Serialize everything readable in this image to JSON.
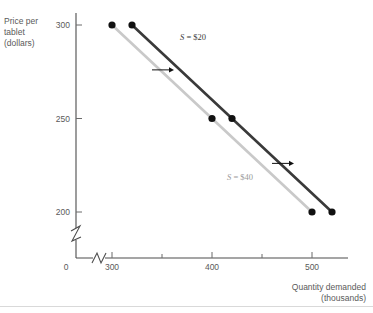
{
  "chart_data": {
    "type": "line",
    "title": "",
    "xlabel": "Quantity demanded",
    "xlabel_sub": "(thousands)",
    "ylabel": "Price per",
    "ylabel_line2": "tablet",
    "ylabel_sub": "(dollars)",
    "origin_label": "0",
    "xlim": [
      280,
      560
    ],
    "ylim": [
      190,
      310
    ],
    "x_ticks_major": [
      300,
      400,
      500
    ],
    "x_ticks_minor": [
      350,
      450,
      550
    ],
    "x_tick_labels": [
      "300",
      "400",
      "500"
    ],
    "y_ticks": [
      200,
      250,
      300
    ],
    "y_tick_labels": [
      "200",
      "250",
      "300"
    ],
    "axis_break": true,
    "grid": false,
    "legend_position": "inline",
    "series": [
      {
        "name": "S = $40",
        "label_prefix": "S",
        "label_equals": " = ",
        "label_value": "$40",
        "color": "#c9c9c9",
        "x": [
          300,
          400,
          500
        ],
        "values": [
          300,
          250,
          200
        ],
        "points": [
          {
            "x": 300,
            "y": 300
          },
          {
            "x": 400,
            "y": 250
          },
          {
            "x": 500,
            "y": 200
          }
        ],
        "label_at": {
          "x": 415,
          "y": 217
        }
      },
      {
        "name": "S = $20",
        "label_prefix": "S",
        "label_equals": " = ",
        "label_value": "$20",
        "color": "#3a3a3a",
        "x": [
          320,
          420,
          520
        ],
        "values": [
          300,
          250,
          200
        ],
        "points": [
          {
            "x": 320,
            "y": 300
          },
          {
            "x": 420,
            "y": 250
          },
          {
            "x": 520,
            "y": 200
          }
        ],
        "label_at": {
          "x": 368,
          "y": 292
        }
      }
    ],
    "annotations": [
      {
        "type": "arrow",
        "name": "shift-arrow-upper",
        "from": {
          "x": 340,
          "y": 276
        },
        "to": {
          "x": 362,
          "y": 276
        }
      },
      {
        "type": "arrow",
        "name": "shift-arrow-lower",
        "from": {
          "x": 460,
          "y": 226
        },
        "to": {
          "x": 482,
          "y": 226
        }
      }
    ],
    "point_marker": {
      "shape": "circle",
      "radius": 3.6,
      "color": "#111111"
    }
  }
}
